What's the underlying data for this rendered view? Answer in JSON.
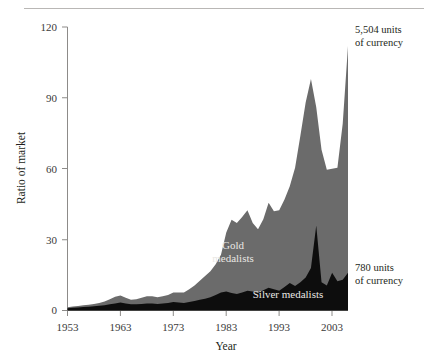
{
  "figure": {
    "background_color": "#ffffff",
    "rule_color": "#b9b7b5"
  },
  "axes": {
    "y_title": "Ratio of market",
    "x_title": "Year",
    "y_ticks": [
      "0",
      "30",
      "60",
      "90",
      "120"
    ],
    "x_ticks": [
      "1953",
      "1963",
      "1973",
      "1983",
      "1993",
      "2003"
    ]
  },
  "labels": {
    "gold_line1": "Gold",
    "gold_line2": "medalists",
    "silver": "Silver medalists"
  },
  "callouts": {
    "top_line1": "5,504 units",
    "top_line2": "of currency",
    "bottom_line1": "780 units",
    "bottom_line2": "of currency"
  },
  "chart_data": {
    "type": "area",
    "stacked": true,
    "title": "",
    "xlabel": "Year",
    "ylabel": "Ratio of market",
    "xlim": [
      1953,
      2006
    ],
    "ylim": [
      0,
      120
    ],
    "grid": false,
    "legend": "in-plot labels",
    "colors": {
      "gold_medalists": "#6b6b6b",
      "silver_medalists": "#0d0d0d",
      "axis": "#8d8b89",
      "text": "#231f20"
    },
    "annotations": [
      {
        "text": "5,504 units of currency",
        "target": "gold medalists top of final spike",
        "x": 2006,
        "y": 112
      },
      {
        "text": "780 units of currency",
        "target": "silver medalists at right edge",
        "x": 2006,
        "y": 16
      }
    ],
    "x": [
      1953,
      1954,
      1955,
      1956,
      1957,
      1958,
      1959,
      1960,
      1961,
      1962,
      1963,
      1964,
      1965,
      1966,
      1967,
      1968,
      1969,
      1970,
      1971,
      1972,
      1973,
      1974,
      1975,
      1976,
      1977,
      1978,
      1979,
      1980,
      1981,
      1982,
      1983,
      1984,
      1985,
      1986,
      1987,
      1988,
      1989,
      1990,
      1991,
      1992,
      1993,
      1994,
      1995,
      1996,
      1997,
      1998,
      1999,
      2000,
      2001,
      2002,
      2003,
      2004,
      2005,
      2006
    ],
    "series": [
      {
        "name": "Silver medalists",
        "color": "#0d0d0d",
        "values": [
          1.0,
          1.2,
          1.3,
          1.5,
          1.6,
          1.8,
          2.0,
          2.2,
          2.6,
          3.0,
          3.4,
          3.0,
          2.6,
          2.6,
          2.8,
          3.0,
          3.0,
          2.8,
          3.0,
          3.2,
          3.6,
          3.4,
          3.2,
          3.6,
          4.0,
          4.6,
          5.0,
          5.6,
          6.6,
          7.6,
          8.0,
          7.4,
          7.0,
          7.6,
          8.4,
          8.0,
          7.4,
          8.6,
          9.6,
          9.0,
          8.4,
          10.0,
          11.6,
          10.4,
          12.0,
          14.0,
          18.0,
          36.0,
          12.0,
          10.6,
          16.0,
          12.4,
          13.0,
          16.0
        ]
      },
      {
        "name": "Gold medalists",
        "color": "#6b6b6b",
        "values": [
          0.4,
          0.5,
          0.6,
          0.7,
          0.8,
          1.0,
          1.2,
          1.6,
          2.2,
          2.8,
          3.0,
          2.4,
          2.0,
          2.2,
          2.6,
          3.0,
          3.0,
          2.8,
          3.0,
          3.4,
          4.0,
          4.2,
          4.4,
          5.4,
          6.6,
          8.0,
          9.6,
          11.0,
          13.0,
          16.0,
          25.0,
          31.0,
          30.0,
          32.0,
          34.0,
          29.0,
          27.0,
          30.0,
          36.0,
          33.0,
          34.0,
          37.0,
          41.0,
          50.0,
          62.0,
          74.0,
          80.0,
          50.0,
          56.0,
          49.0,
          44.0,
          48.0,
          66.0,
          96.0
        ]
      }
    ],
    "totals_note": "Stacked totals peak at about 86 in 1999 and about 112 at the right edge"
  }
}
